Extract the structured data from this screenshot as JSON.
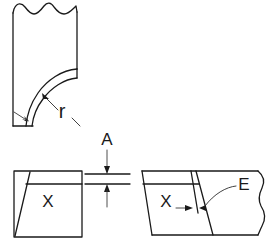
{
  "figure": {
    "background_color": "#ffffff",
    "line_color": "#1a1a1a",
    "labels": {
      "radius": "r",
      "gap": "A",
      "edge": "E",
      "section_left": "X",
      "section_right": "X"
    }
  },
  "views": {
    "top_left": {
      "name": "radius-detail-view",
      "description": "Block with wavy break line at top and curved fillet band at lower right",
      "label": "r"
    },
    "bottom_left": {
      "name": "mating-part-left-view",
      "description": "Rectangular block with diagonal chamfer and horizontal step line",
      "label": "X"
    },
    "bottom_right": {
      "name": "mating-part-right-view",
      "description": "Block with wavy break line on right side, slanted edge lines and E callout",
      "label": "X"
    },
    "gap_dimension": {
      "name": "gap-dimension-A",
      "label": "A",
      "description": "Vertical gap dimension between two horizontal reference lines"
    },
    "edge_dimension": {
      "name": "edge-dimension-E",
      "label": "E",
      "description": "Narrow width dimension between two slanted lines"
    }
  }
}
